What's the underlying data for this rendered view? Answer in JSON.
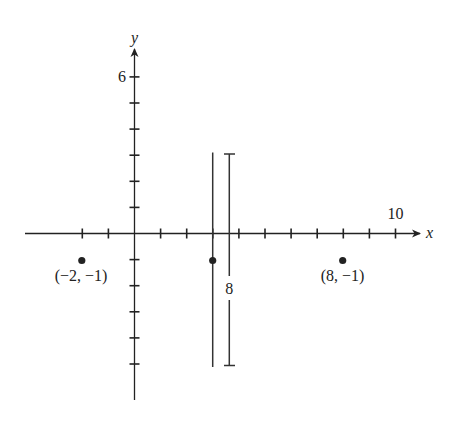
{
  "diagram": {
    "type": "coordinate-plane",
    "axes": {
      "x_label": "x",
      "y_label": "y",
      "x_tick_label": "10",
      "y_tick_label": "6",
      "x_range": [
        -4,
        11
      ],
      "y_range": [
        -6,
        6
      ],
      "tick_spacing": 1
    },
    "points": [
      {
        "x": -2,
        "y": -1,
        "label": "(−2, −1)"
      },
      {
        "x": 3,
        "y": -1,
        "label": ""
      },
      {
        "x": 8,
        "y": -1,
        "label": "(8, −1)"
      }
    ],
    "vertical_line": {
      "x": 3,
      "y_from": 3.2,
      "y_to": -5.0
    },
    "distance_marker": {
      "label": "8",
      "y_from": 3.1,
      "y_to": -4.9
    }
  }
}
